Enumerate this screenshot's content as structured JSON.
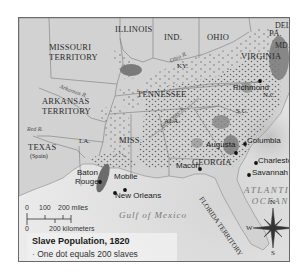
{
  "map": {
    "title": "Slave Population, 1820",
    "legend": {
      "title": "Slave Population, 1820",
      "items": [
        {
          "symbol": "dot",
          "label": "One dot equals 200 slaves"
        }
      ]
    },
    "regions": {
      "illinois": "ILLINOIS",
      "indiana": "IND.",
      "ohio": "OHIO",
      "pennsylvania": "PA.",
      "delaware": "DEL.",
      "maryland": "MD.",
      "missouri_1": "MISSOURI",
      "missouri_2": "TERRITORY",
      "arkansas_1": "ARKANSAS",
      "arkansas_2": "TERRITORY",
      "kentucky": "KY.",
      "virginia": "VIRGINIA",
      "tennessee": "TENNESSEE",
      "north_carolina": "N.C.",
      "south_carolina": "S.C.",
      "alabama": "ALA.",
      "mississippi": "MISS.",
      "louisiana": "LA.",
      "georgia": "GEORGIA",
      "texas": "TEXAS",
      "texas_sub": "(Spain)",
      "florida": "FLORIDA TERRITORY"
    },
    "rivers": {
      "ohio": "Ohio R.",
      "arkansas": "Arkansas R.",
      "red": "Red R.",
      "tennessee": "Tennessee R."
    },
    "cities": {
      "richmond": "Richmond",
      "columbia": "Columbia",
      "augusta": "Augusta",
      "charleston": "Charleston",
      "macon": "Macon",
      "savannah": "Savannah",
      "baton_rouge_1": "Baton",
      "baton_rouge_2": "Rouge",
      "mobile": "Mobile",
      "new_orleans": "New Orleans"
    },
    "water": {
      "atlantic_1": "ATLANTIC",
      "atlantic_2": "OCEAN",
      "gulf": "Gulf of Mexico"
    },
    "scale": {
      "miles_ticks": [
        "0",
        "100",
        "200 miles"
      ],
      "km_ticks": [
        "0",
        "200 kilometers"
      ]
    },
    "compass": {
      "n": "N",
      "s": "S",
      "e": "E",
      "w": "W"
    }
  }
}
